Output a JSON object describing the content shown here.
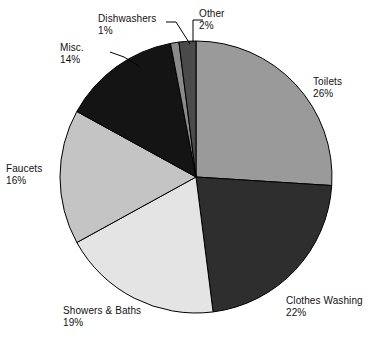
{
  "chart_data": {
    "type": "pie",
    "title": "",
    "subtitle": "",
    "xlabel": "",
    "ylabel": "",
    "legend_position": "none",
    "grid": false,
    "labels_outside": true,
    "value_suffix": "%",
    "categories": [
      "Toilets",
      "Clothes Washing",
      "Showers & Baths",
      "Faucets",
      "Misc.",
      "Dishwashers",
      "Other"
    ],
    "values": [
      26,
      22,
      19,
      16,
      14,
      1,
      2
    ],
    "total": 100,
    "slices": [
      {
        "label": "Toilets",
        "value": 26,
        "value_text": "26%",
        "color": "#9a9a9a",
        "start_angle": 0,
        "end_angle": 93.6,
        "label_x": 313,
        "label_y": 76,
        "align": "left",
        "leader": false
      },
      {
        "label": "Clothes Washing",
        "value": 22,
        "value_text": "22%",
        "color": "#2e2e2e",
        "start_angle": 93.6,
        "end_angle": 172.8,
        "label_x": 286,
        "label_y": 295,
        "align": "left",
        "leader": false
      },
      {
        "label": "Showers & Baths",
        "value": 19,
        "value_text": "19%",
        "color": "#e4e4e4",
        "start_angle": 172.8,
        "end_angle": 241.2,
        "label_x": 63,
        "label_y": 305,
        "align": "left",
        "leader": false
      },
      {
        "label": "Faucets",
        "value": 16,
        "value_text": "16%",
        "color": "#c4c4c4",
        "start_angle": 241.2,
        "end_angle": 298.8,
        "label_x": 6,
        "label_y": 163,
        "align": "left",
        "leader": false
      },
      {
        "label": "Misc.",
        "value": 14,
        "value_text": "14%",
        "color": "#141414",
        "start_angle": 298.8,
        "end_angle": 349.2,
        "label_x": 60,
        "label_y": 42,
        "align": "left",
        "leader": true
      },
      {
        "label": "Dishwashers",
        "value": 1,
        "value_text": "1%",
        "color": "#8a8a8a",
        "start_angle": 349.2,
        "end_angle": 352.8,
        "label_x": 98,
        "label_y": 13,
        "align": "left",
        "leader": true
      },
      {
        "label": "Other",
        "value": 2,
        "value_text": "2%",
        "color": "#4a4a4a",
        "start_angle": 352.8,
        "end_angle": 360,
        "label_x": 199,
        "label_y": 8,
        "align": "left",
        "leader": true
      }
    ],
    "geometry": {
      "center_x": 196,
      "center_y": 177,
      "radius": 136
    },
    "colors": {
      "background": "#ffffff",
      "outline": "#000000",
      "text": "#111111"
    }
  }
}
